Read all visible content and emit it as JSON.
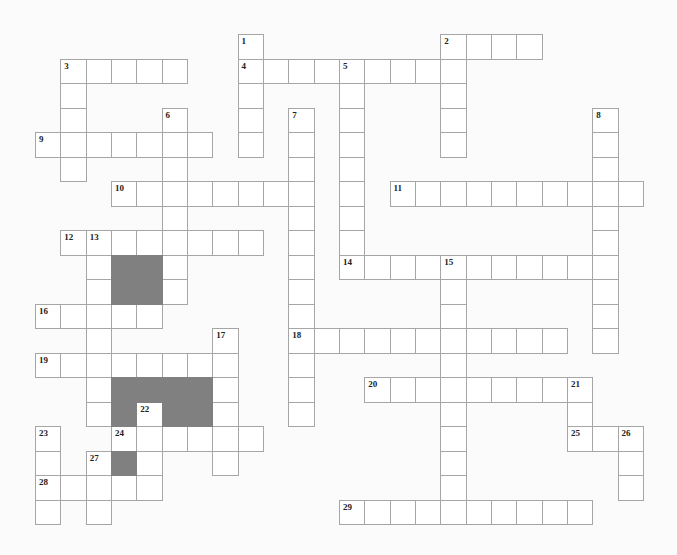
{
  "puzzle": {
    "grid": {
      "origin_x": 35,
      "origin_y": 34,
      "cell_w": 25.33,
      "cell_h": 24.5,
      "line_color": "#a6a6a6",
      "block_color": "#808080"
    },
    "words": [
      {
        "number": "1",
        "dir": "down",
        "row": 0,
        "col": 8,
        "length": 5
      },
      {
        "number": "2",
        "dir": "across",
        "row": 0,
        "col": 16,
        "length": 4
      },
      {
        "number": "2",
        "dir": "down",
        "row": 0,
        "col": 16,
        "length": 5
      },
      {
        "number": "3",
        "dir": "across",
        "row": 1,
        "col": 1,
        "length": 5
      },
      {
        "number": "3",
        "dir": "down",
        "row": 1,
        "col": 1,
        "length": 5
      },
      {
        "number": "4",
        "dir": "across",
        "row": 1,
        "col": 8,
        "length": 9
      },
      {
        "number": "5",
        "dir": "down",
        "row": 1,
        "col": 12,
        "length": 9
      },
      {
        "number": "6",
        "dir": "down",
        "row": 3,
        "col": 5,
        "length": 8
      },
      {
        "number": "7",
        "dir": "down",
        "row": 3,
        "col": 10,
        "length": 13
      },
      {
        "number": "8",
        "dir": "down",
        "row": 3,
        "col": 22,
        "length": 10
      },
      {
        "number": "9",
        "dir": "across",
        "row": 4,
        "col": 0,
        "length": 7
      },
      {
        "number": "10",
        "dir": "across",
        "row": 6,
        "col": 3,
        "length": 8
      },
      {
        "number": "11",
        "dir": "across",
        "row": 6,
        "col": 14,
        "length": 10
      },
      {
        "number": "12",
        "dir": "across",
        "row": 8,
        "col": 1,
        "length": 8
      },
      {
        "number": "13",
        "dir": "down",
        "row": 8,
        "col": 2,
        "length": 8
      },
      {
        "number": "14",
        "dir": "across",
        "row": 9,
        "col": 12,
        "length": 11
      },
      {
        "number": "15",
        "dir": "down",
        "row": 9,
        "col": 16,
        "length": 11
      },
      {
        "number": "16",
        "dir": "across",
        "row": 11,
        "col": 0,
        "length": 5
      },
      {
        "number": "17",
        "dir": "down",
        "row": 12,
        "col": 7,
        "length": 6
      },
      {
        "number": "18",
        "dir": "across",
        "row": 12,
        "col": 10,
        "length": 11
      },
      {
        "number": "19",
        "dir": "across",
        "row": 13,
        "col": 0,
        "length": 8
      },
      {
        "number": "20",
        "dir": "across",
        "row": 14,
        "col": 13,
        "length": 9
      },
      {
        "number": "21",
        "dir": "down",
        "row": 14,
        "col": 21,
        "length": 3
      },
      {
        "number": "22",
        "dir": "down",
        "row": 15,
        "col": 4,
        "length": 4
      },
      {
        "number": "23",
        "dir": "down",
        "row": 16,
        "col": 0,
        "length": 4
      },
      {
        "number": "24",
        "dir": "across",
        "row": 16,
        "col": 3,
        "length": 6
      },
      {
        "number": "25",
        "dir": "across",
        "row": 16,
        "col": 21,
        "length": 3
      },
      {
        "number": "26",
        "dir": "down",
        "row": 16,
        "col": 23,
        "length": 3
      },
      {
        "number": "27",
        "dir": "down",
        "row": 17,
        "col": 2,
        "length": 3
      },
      {
        "number": "28",
        "dir": "across",
        "row": 18,
        "col": 0,
        "length": 5
      },
      {
        "number": "29",
        "dir": "across",
        "row": 19,
        "col": 12,
        "length": 10
      }
    ],
    "blocks": [
      [
        9,
        3
      ],
      [
        9,
        4
      ],
      [
        10,
        3
      ],
      [
        10,
        4
      ],
      [
        14,
        3
      ],
      [
        14,
        4
      ],
      [
        14,
        5
      ],
      [
        14,
        6
      ],
      [
        15,
        3
      ],
      [
        15,
        5
      ],
      [
        15,
        6
      ],
      [
        17,
        3
      ]
    ]
  }
}
